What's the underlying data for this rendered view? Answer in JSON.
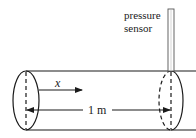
{
  "figure": {
    "type": "pipe-pressure-diagram",
    "labels": {
      "sensor_line1": "pressure",
      "sensor_line2": "sensor",
      "x_axis": "x",
      "length": "1 m"
    },
    "colors": {
      "stroke": "#1a1a1a",
      "background": "#ffffff"
    }
  }
}
